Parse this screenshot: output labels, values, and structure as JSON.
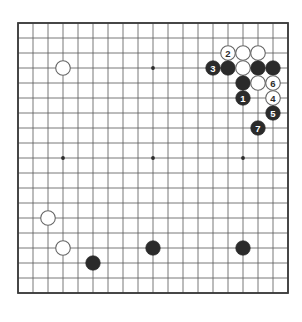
{
  "board": {
    "name": "go-board",
    "size": 19,
    "origin_x": 18,
    "origin_y": 23,
    "spacing": 15,
    "line_color": "#555555",
    "border_color": "#3a3a3a",
    "background_color": "#ffffff",
    "black_color": "#2b2b2b",
    "white_color": "#ffffff",
    "white_outline_color": "#666666",
    "star_points": [
      {
        "col": 3,
        "row": 3
      },
      {
        "col": 9,
        "row": 3
      },
      {
        "col": 15,
        "row": 3
      },
      {
        "col": 3,
        "row": 9
      },
      {
        "col": 9,
        "row": 9
      },
      {
        "col": 15,
        "row": 9
      },
      {
        "col": 3,
        "row": 15
      },
      {
        "col": 9,
        "row": 15
      },
      {
        "col": 15,
        "row": 15
      }
    ],
    "stones": [
      {
        "col": 3,
        "row": 3,
        "color": "white",
        "label": ""
      },
      {
        "col": 14,
        "row": 2,
        "color": "white",
        "label": "2"
      },
      {
        "col": 15,
        "row": 2,
        "color": "white",
        "label": ""
      },
      {
        "col": 16,
        "row": 2,
        "color": "white",
        "label": ""
      },
      {
        "col": 13,
        "row": 3,
        "color": "black",
        "label": "3"
      },
      {
        "col": 14,
        "row": 3,
        "color": "black",
        "label": ""
      },
      {
        "col": 15,
        "row": 3,
        "color": "white",
        "label": ""
      },
      {
        "col": 16,
        "row": 3,
        "color": "black",
        "label": ""
      },
      {
        "col": 17,
        "row": 3,
        "color": "black",
        "label": ""
      },
      {
        "col": 15,
        "row": 4,
        "color": "black",
        "label": ""
      },
      {
        "col": 16,
        "row": 4,
        "color": "white",
        "label": ""
      },
      {
        "col": 17,
        "row": 4,
        "color": "white",
        "label": "6"
      },
      {
        "col": 15,
        "row": 5,
        "color": "black",
        "label": "1"
      },
      {
        "col": 17,
        "row": 5,
        "color": "white",
        "label": "4"
      },
      {
        "col": 17,
        "row": 6,
        "color": "black",
        "label": "5"
      },
      {
        "col": 16,
        "row": 7,
        "color": "black",
        "label": "7"
      },
      {
        "col": 2,
        "row": 13,
        "color": "white",
        "label": ""
      },
      {
        "col": 3,
        "row": 15,
        "color": "white",
        "label": ""
      },
      {
        "col": 5,
        "row": 16,
        "color": "black",
        "label": ""
      },
      {
        "col": 9,
        "row": 15,
        "color": "black",
        "label": ""
      },
      {
        "col": 15,
        "row": 15,
        "color": "black",
        "label": ""
      }
    ]
  }
}
